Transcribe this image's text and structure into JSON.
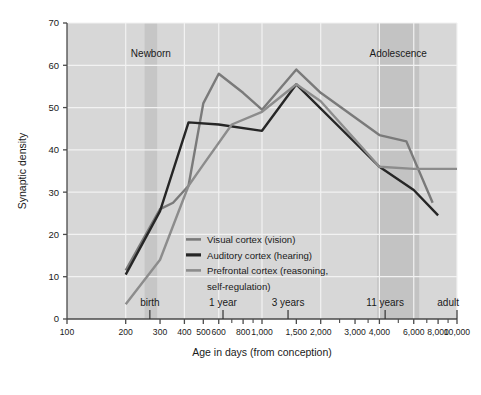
{
  "chart_data": {
    "type": "line",
    "title": "",
    "xlabel": "Age in days (from conception)",
    "ylabel": "Synaptic density",
    "xscale": "log",
    "xlim": [
      100,
      10000
    ],
    "ylim": [
      0,
      70
    ],
    "grid": true,
    "legend_position": "inside-center",
    "x_tick_labels": [
      "100",
      "200",
      "300",
      "400",
      "500",
      "600",
      "800",
      "1,000",
      "1,500",
      "2,000",
      "3,000",
      "4,000",
      "6,000",
      "8,000",
      "10,000"
    ],
    "x_tick_values": [
      100,
      200,
      300,
      400,
      500,
      600,
      800,
      1000,
      1500,
      2000,
      3000,
      4000,
      6000,
      8000,
      10000
    ],
    "x_gridline_values": [
      200,
      400,
      600,
      1000,
      2000,
      4000,
      6000,
      10000
    ],
    "y_tick_labels": [
      "0",
      "10",
      "20",
      "30",
      "40",
      "50",
      "60",
      "70"
    ],
    "y_tick_values": [
      0,
      10,
      20,
      30,
      40,
      50,
      60,
      70
    ],
    "stage_markers": [
      {
        "label": "birth",
        "value": 266
      },
      {
        "label": "1 year",
        "value": 631
      },
      {
        "label": "3 years",
        "value": 1360
      },
      {
        "label": "11 years",
        "value": 4280
      },
      {
        "label": "adult",
        "value": 10000
      }
    ],
    "bands": [
      {
        "label": "Newborn",
        "x_start": 250,
        "x_end": 290,
        "color": "#c6c6c6"
      },
      {
        "label": "Adolescence",
        "x_start": 3900,
        "x_end": 6400,
        "color": "#c3c3c3"
      }
    ],
    "series": [
      {
        "name": "Visual cortex (vision)",
        "color": "#7a7a7a",
        "width": 2.4,
        "points": [
          [
            200,
            11.5
          ],
          [
            300,
            26.0
          ],
          [
            350,
            27.5
          ],
          [
            420,
            31.5
          ],
          [
            500,
            51.0
          ],
          [
            600,
            58.0
          ],
          [
            800,
            53.5
          ],
          [
            1000,
            49.5
          ],
          [
            1500,
            59.0
          ],
          [
            2000,
            53.5
          ],
          [
            4000,
            43.5
          ],
          [
            5500,
            42.0
          ],
          [
            7500,
            27.5
          ]
        ]
      },
      {
        "name": "Auditory cortex (hearing)",
        "color": "#262626",
        "width": 2.4,
        "points": [
          [
            200,
            10.5
          ],
          [
            300,
            25.5
          ],
          [
            420,
            46.5
          ],
          [
            600,
            46.0
          ],
          [
            1000,
            44.5
          ],
          [
            1500,
            55.5
          ],
          [
            4000,
            36.0
          ],
          [
            6000,
            30.5
          ],
          [
            8000,
            24.5
          ]
        ]
      },
      {
        "name": "Prefrontal cortex (reasoning, self-regulation)",
        "color": "#8c8c8c",
        "width": 2.4,
        "points": [
          [
            200,
            3.5
          ],
          [
            300,
            14.0
          ],
          [
            420,
            31.5
          ],
          [
            500,
            36.5
          ],
          [
            700,
            46.0
          ],
          [
            1000,
            49.0
          ],
          [
            1500,
            55.5
          ],
          [
            2000,
            51.5
          ],
          [
            4000,
            36.0
          ],
          [
            6000,
            35.5
          ],
          [
            10000,
            35.5
          ]
        ]
      }
    ]
  },
  "axes": {
    "y_title": "Synaptic density",
    "x_title": "Age in days (from conception)"
  },
  "legend": {
    "entries": [
      {
        "label": "Visual cortex (vision)",
        "color": "#7a7a7a"
      },
      {
        "label": "Auditory cortex (hearing)",
        "color": "#262626"
      },
      {
        "label": "Prefrontal cortex (reasoning,",
        "color": "#8c8c8c"
      },
      {
        "label": "self-regulation)",
        "color": ""
      }
    ]
  },
  "colors": {
    "plot_background": "#d7d7d7",
    "gridline": "#f2f2f2",
    "axis": "#4a4a4a",
    "text": "#1a1a1a"
  }
}
